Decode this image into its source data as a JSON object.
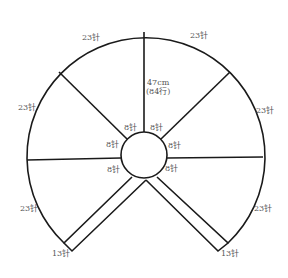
{
  "diagram": {
    "colors": {
      "stroke": "#1a1a1a",
      "text": "#555555",
      "background": "#ffffff"
    },
    "dimension": {
      "length": "47cm",
      "rows": "(84行)"
    },
    "outer_labels": [
      "23针",
      "23针",
      "23针",
      "23针",
      "23针",
      "23针"
    ],
    "inner_labels": [
      "8针",
      "8针",
      "8针",
      "8针",
      "8针",
      "8针"
    ],
    "strip_end_labels": [
      "13针",
      "13针"
    ]
  }
}
